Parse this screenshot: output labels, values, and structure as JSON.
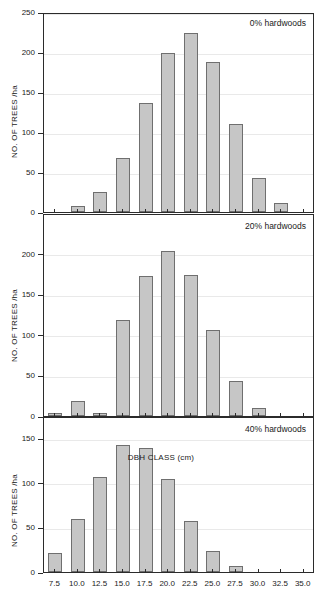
{
  "figure": {
    "xlabel": "DBH CLASS (cm)",
    "ylabel": "NO. OF TREES /ha"
  },
  "chart_data": [
    {
      "type": "bar",
      "title": "0% hardwoods",
      "xlabel": "DBH CLASS (cm)",
      "ylabel": "NO. OF TREES /ha",
      "categories": [
        "7.5",
        "10.0",
        "12.5",
        "15.0",
        "17.5",
        "20.0",
        "22.5",
        "25.0",
        "27.5",
        "30.0",
        "32.5",
        "35.0"
      ],
      "values": [
        0,
        7,
        25,
        68,
        136,
        199,
        224,
        187,
        110,
        42,
        11,
        0
      ],
      "ylim": [
        0,
        250
      ],
      "yticks": [
        "0",
        "50",
        "100",
        "150",
        "200",
        "250"
      ],
      "grid": true,
      "legend": "none"
    },
    {
      "type": "bar",
      "title": "20% hardwoods",
      "xlabel": "DBH CLASS (cm)",
      "ylabel": "NO. OF TREES /ha",
      "categories": [
        "7.5",
        "10.0",
        "12.5",
        "15.0",
        "17.5",
        "20.0",
        "22.5",
        "25.0",
        "27.5",
        "30.0",
        "32.5",
        "35.0"
      ],
      "values": [
        4,
        19,
        4,
        118,
        173,
        203,
        174,
        106,
        43,
        10,
        0,
        0
      ],
      "ylim": [
        0,
        250
      ],
      "yticks": [
        "0",
        "50",
        "100",
        "150",
        "200"
      ],
      "grid": true,
      "legend": "none"
    },
    {
      "type": "bar",
      "title": "40% hardwoods",
      "xlabel": "DBH CLASS (cm)",
      "ylabel": "NO. OF TREES /ha",
      "categories": [
        "7.5",
        "10.0",
        "12.5",
        "15.0",
        "17.5",
        "20.0",
        "22.5",
        "25.0",
        "27.5",
        "30.0",
        "32.5",
        "35.0"
      ],
      "values": [
        21,
        60,
        107,
        142,
        139,
        104,
        57,
        24,
        7,
        0,
        0,
        0
      ],
      "ylim": [
        0,
        175
      ],
      "yticks": [
        "0",
        "50",
        "100",
        "150"
      ],
      "grid": true,
      "legend": "none"
    }
  ]
}
